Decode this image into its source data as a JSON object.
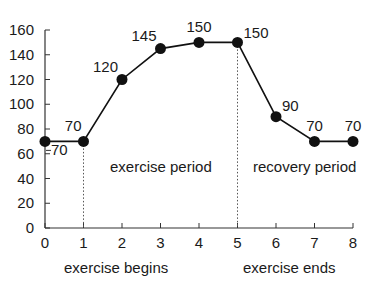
{
  "chart_data": {
    "type": "line",
    "title": "",
    "xlabel": "",
    "ylabel": "",
    "x": [
      0,
      1,
      2,
      3,
      4,
      5,
      6,
      7,
      8
    ],
    "series": [
      {
        "name": "value",
        "values": [
          70,
          70,
          120,
          145,
          150,
          150,
          90,
          70,
          70
        ]
      }
    ],
    "data_labels": [
      "70",
      "70",
      "120",
      "145",
      "150",
      "150",
      "90",
      "70",
      "70"
    ],
    "xlim": [
      0,
      8
    ],
    "ylim": [
      0,
      160
    ],
    "x_ticks": [
      "0",
      "1",
      "2",
      "3",
      "4",
      "5",
      "6",
      "7",
      "8"
    ],
    "y_ticks": [
      "0",
      "20",
      "40",
      "60",
      "80",
      "100",
      "120",
      "140",
      "160"
    ],
    "grid": false,
    "legend": null,
    "annotations": [
      {
        "text": "exercise period",
        "region": "between x=1 and x=5"
      },
      {
        "text": "recovery period",
        "region": "between x=5 and x=8"
      },
      {
        "text": "exercise begins",
        "at_x": 1,
        "position": "below axis"
      },
      {
        "text": "exercise ends",
        "at_x": 5,
        "position": "below axis"
      }
    ],
    "vertical_markers": [
      {
        "x": 1,
        "style": "dotted"
      },
      {
        "x": 5,
        "style": "dotted"
      }
    ]
  },
  "labels": {
    "exercise_period": "exercise period",
    "recovery_period": "recovery period",
    "exercise_begins": "exercise begins",
    "exercise_ends": "exercise ends"
  },
  "colors": {
    "line": "#111111",
    "marker": "#111111",
    "axis": "#333333",
    "text": "#1a1a1a"
  }
}
